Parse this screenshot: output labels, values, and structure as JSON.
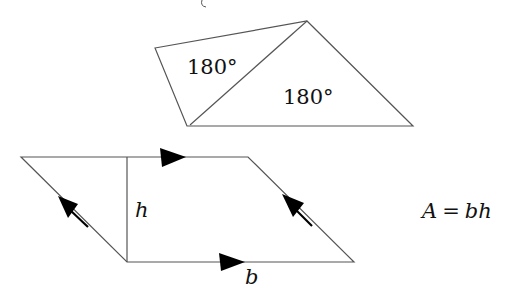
{
  "top_figure": {
    "description": "quadrilateral split into two triangles",
    "triangle_left_label": "180°",
    "triangle_right_label": "180°"
  },
  "bottom_figure": {
    "description": "parallelogram with height and base",
    "height_label": "h",
    "base_label": "b"
  },
  "formula": {
    "lhs": "A",
    "eq": "=",
    "rhs": "bh"
  },
  "colors": {
    "line": "#444444",
    "arrow": "#000000",
    "text": "#111111"
  }
}
